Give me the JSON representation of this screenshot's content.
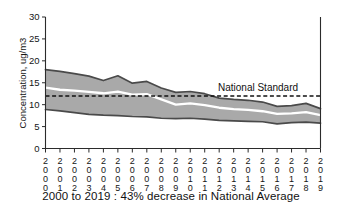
{
  "chart_data": {
    "type": "area",
    "title": "",
    "subtitle": "",
    "xlabel": "",
    "ylabel": "Concentration, ug/m3",
    "ylim": [
      0,
      30
    ],
    "yticks": [
      0,
      5,
      10,
      15,
      20,
      25,
      30
    ],
    "grid": false,
    "legend_position": "none",
    "categories": [
      "2000",
      "2001",
      "2002",
      "2003",
      "2004",
      "2005",
      "2006",
      "2007",
      "2008",
      "2009",
      "2010",
      "2011",
      "2012",
      "2013",
      "2014",
      "2015",
      "2016",
      "2017",
      "2018",
      "2019"
    ],
    "x": [
      2000,
      2001,
      2002,
      2003,
      2004,
      2005,
      2006,
      2007,
      2008,
      2009,
      2010,
      2011,
      2012,
      2013,
      2014,
      2015,
      2016,
      2017,
      2018,
      2019
    ],
    "series": [
      {
        "name": "90th Percentile",
        "values": [
          18.0,
          17.6,
          17.1,
          16.5,
          15.5,
          16.6,
          14.9,
          15.3,
          13.8,
          12.8,
          13.0,
          12.5,
          11.5,
          11.2,
          11.0,
          10.6,
          9.6,
          9.8,
          10.3,
          9.1
        ]
      },
      {
        "name": "National Average",
        "values": [
          13.9,
          13.4,
          13.2,
          12.9,
          12.6,
          13.0,
          12.3,
          12.4,
          11.2,
          10.0,
          10.3,
          9.9,
          9.3,
          9.0,
          8.8,
          8.5,
          7.9,
          8.0,
          8.3,
          7.6
        ]
      },
      {
        "name": "10th Percentile",
        "values": [
          8.9,
          8.6,
          8.2,
          7.8,
          7.6,
          7.5,
          7.3,
          7.2,
          6.9,
          6.8,
          6.9,
          6.7,
          6.4,
          6.3,
          6.2,
          6.1,
          5.6,
          5.9,
          6.0,
          5.8
        ]
      }
    ],
    "annotations": [
      {
        "name": "national-standard",
        "label": "National Standard",
        "value": 12.0,
        "style": "dashed-horizontal-line"
      }
    ]
  },
  "axes": {
    "y_title": "Concentration, ug/m3",
    "y_tick_labels": [
      "0",
      "5",
      "10",
      "15",
      "20",
      "25",
      "30"
    ],
    "x_tick_labels": [
      "2000",
      "2001",
      "2002",
      "2003",
      "2004",
      "2005",
      "2006",
      "2007",
      "2008",
      "2009",
      "2010",
      "2011",
      "2012",
      "2013",
      "2014",
      "2015",
      "2016",
      "2017",
      "2018",
      "2019"
    ]
  },
  "annotation": {
    "national_standard_label": "National Standard"
  },
  "caption": {
    "text": "2000 to 2019 : 43% decrease in National Average"
  },
  "colors": {
    "band_fill": "#a9a9a9",
    "band_edge": "#4a4a4a",
    "mean_line": "#ffffff",
    "standard_line": "#111111",
    "axis": "#2b2b2b",
    "background": "#ffffff"
  }
}
